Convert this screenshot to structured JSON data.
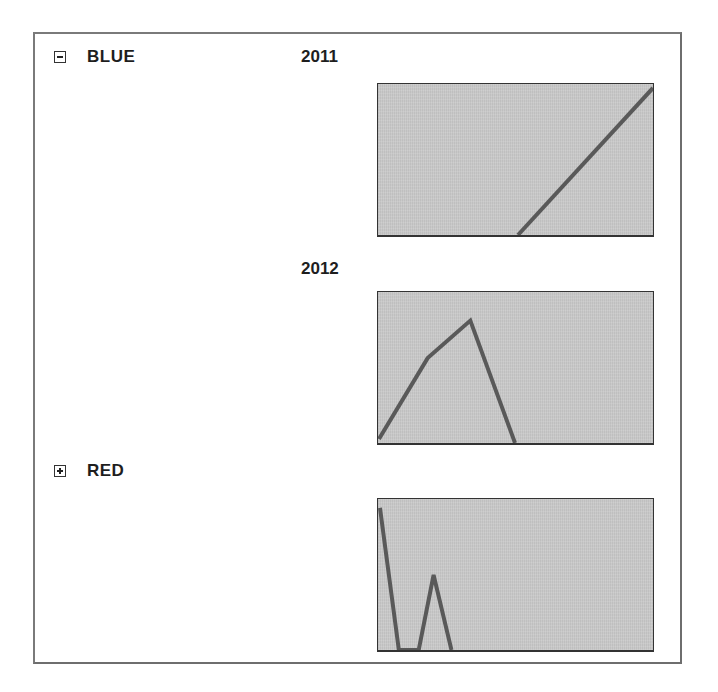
{
  "groups": [
    {
      "label": "BLUE",
      "expanded": true,
      "toggle_icon": "collapse-minus-icon",
      "years": [
        {
          "label": "2011",
          "sparkline_points": "141,153 277,4"
        },
        {
          "label": "2012",
          "sparkline_points": "1,149 50,67 93,29 138,153"
        }
      ]
    },
    {
      "label": "RED",
      "expanded": false,
      "toggle_icon": "expand-plus-icon",
      "years": [
        {
          "label": "",
          "sparkline_points": "2,9 21,153 41,153 56,77 74,153"
        }
      ]
    }
  ],
  "colors": {
    "sparkline_fill": "#c9c9c9",
    "sparkline_line": "#595959",
    "border": "#333333",
    "text": "#1e1e1e"
  }
}
